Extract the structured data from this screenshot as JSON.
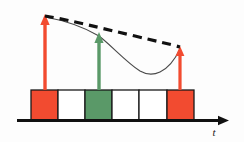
{
  "figure": {
    "background_color": "#fdfdfd",
    "axis": {
      "label": "t",
      "label_name": "time-axis-label",
      "color": "#111111",
      "x_start": 17,
      "x_end": 228,
      "y": 120,
      "thickness": 3,
      "arrow_head": true
    },
    "colors": {
      "red": "#F24B30",
      "red_stroke": "#C03A22",
      "green": "#5A9968",
      "green_stroke": "#3E6D4A",
      "white": "#FFFFFF",
      "box_outline": "#1a1a1a",
      "dashed_curve": "#111111",
      "thin_curve": "#4a4a4a"
    },
    "boxes": [
      {
        "name": "box-1-red",
        "fill": "#F24B30",
        "x": 31,
        "width": 27,
        "index": 1
      },
      {
        "name": "box-2-white",
        "fill": "#FFFFFF",
        "x": 58,
        "width": 27,
        "index": 2
      },
      {
        "name": "box-3-green",
        "fill": "#5A9968",
        "x": 85,
        "width": 27,
        "index": 3
      },
      {
        "name": "box-4-white",
        "fill": "#FFFFFF",
        "x": 112,
        "width": 27,
        "index": 4
      },
      {
        "name": "box-5-white",
        "fill": "#FFFFFF",
        "x": 139,
        "width": 28,
        "index": 5
      },
      {
        "name": "box-6-red",
        "fill": "#F24B30",
        "x": 167,
        "width": 27,
        "index": 6
      }
    ],
    "box_geometry": {
      "top": 90,
      "bottom": 120,
      "height": 30
    },
    "arrows": [
      {
        "name": "pulse-arrow-1-red",
        "color": "#F24B30",
        "x": 45,
        "y_base": 90,
        "y_tip": 17,
        "height_units": 73
      },
      {
        "name": "pulse-arrow-2-green",
        "color": "#5A9968",
        "x": 99,
        "y_base": 90,
        "y_tip": 34,
        "height_units": 56
      },
      {
        "name": "pulse-arrow-3-red",
        "color": "#F24B30",
        "x": 180,
        "y_base": 90,
        "y_tip": 48,
        "height_units": 42
      }
    ],
    "dashed_envelope": {
      "name": "dashed-envelope-curve",
      "color": "#111111",
      "dash_pattern": "9 6",
      "stroke_width": 3.2,
      "points": [
        [
          45,
          16
        ],
        [
          90,
          26
        ],
        [
          135,
          36
        ],
        [
          180,
          47
        ]
      ]
    },
    "thin_curve": {
      "name": "thin-response-curve",
      "color": "#4a4a4a",
      "stroke_width": 1.1,
      "points": [
        [
          45,
          17
        ],
        [
          70,
          23
        ],
        [
          99,
          35
        ],
        [
          120,
          55
        ],
        [
          140,
          71
        ],
        [
          158,
          73
        ],
        [
          172,
          63
        ],
        [
          180,
          49
        ]
      ]
    }
  }
}
